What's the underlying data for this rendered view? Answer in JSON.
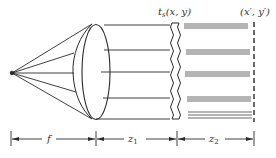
{
  "diagram": {
    "type": "optical-setup",
    "labels": {
      "transparency": "t",
      "transparency_sub": "s",
      "transparency_args": "(x, y)",
      "observation_plane": "(x′, y′)",
      "focal_length": "f",
      "distance1": "z",
      "distance1_sub": "1",
      "distance2": "z",
      "distance2_sub": "2"
    },
    "elements": [
      {
        "name": "point-source"
      },
      {
        "name": "lens"
      },
      {
        "name": "transparency"
      },
      {
        "name": "observation-plane"
      }
    ],
    "stroke_color": "#2a2a2a"
  }
}
